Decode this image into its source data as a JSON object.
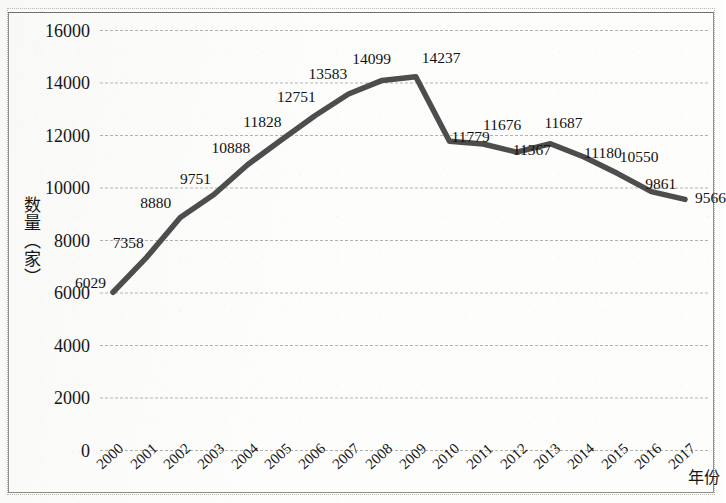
{
  "chart_data": {
    "type": "line",
    "title": "",
    "subtitle": "",
    "xlabel": "年份",
    "ylabel": "数量（家）",
    "categories": [
      "2000",
      "2001",
      "2002",
      "2003",
      "2004",
      "2005",
      "2006",
      "2007",
      "2008",
      "2009",
      "2010",
      "2011",
      "2012",
      "2013",
      "2014",
      "2015",
      "2016",
      "2017"
    ],
    "values": [
      6029,
      7358,
      8880,
      9751,
      10888,
      11828,
      12751,
      13583,
      14099,
      14237,
      11779,
      11676,
      11367,
      11687,
      11180,
      10550,
      9861,
      9566
    ],
    "data_labels": [
      "6029",
      "7358",
      "8880",
      "9751",
      "10888",
      "11828",
      "12751",
      "13583",
      "14099",
      "14237",
      "11779",
      "11676",
      "11367",
      "11687",
      "11180",
      "10550",
      "9861",
      "9566"
    ],
    "ylim": [
      0,
      16000
    ],
    "yticks": [
      0,
      2000,
      4000,
      6000,
      8000,
      10000,
      12000,
      14000,
      16000
    ],
    "ytick_labels": [
      "0",
      "2000",
      "4000",
      "6000",
      "8000",
      "10000",
      "12000",
      "14000",
      "16000"
    ],
    "grid": true,
    "grid_axis": "y",
    "legend": false,
    "legend_position": "none",
    "series": [
      {
        "name": "数量（家）",
        "color": "#4d4d4d",
        "values": [
          6029,
          7358,
          8880,
          9751,
          10888,
          11828,
          12751,
          13583,
          14099,
          14237,
          11779,
          11676,
          11367,
          11687,
          11180,
          10550,
          9861,
          9566
        ]
      }
    ],
    "colors": {
      "line": "#4d4d4d",
      "gridline": "#b3b3ae",
      "frame": "#8d8d88",
      "text": "#161616",
      "background": "#fdfdfc"
    }
  }
}
